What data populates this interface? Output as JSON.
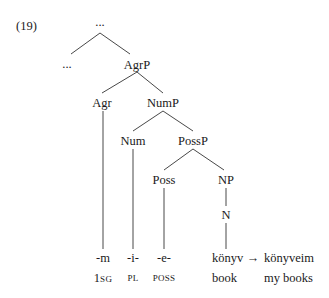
{
  "example_number": "(19)",
  "tree": {
    "root": "...",
    "left_sibling": "...",
    "agrp": "AgrP",
    "agr": "Agr",
    "nump": "NumP",
    "num": "Num",
    "possp": "PossP",
    "poss": "Poss",
    "np": "NP",
    "n": "N"
  },
  "morphemes": {
    "agr": "-m",
    "num": "-i-",
    "poss": "-e-",
    "stem": "könyv",
    "arrow": "→",
    "result": "könyveim"
  },
  "glosses": {
    "agr_num": "1",
    "agr_sc": "SG",
    "num": "PL",
    "poss": "POSS",
    "stem": "book",
    "result": "my books"
  }
}
